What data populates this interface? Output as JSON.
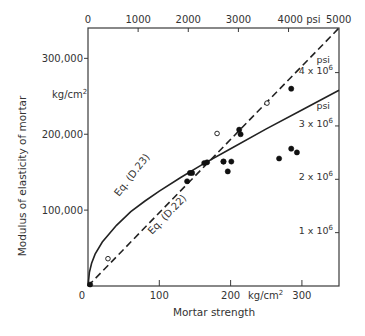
{
  "chart_data": {
    "type": "scatter",
    "title": "",
    "xlabel": "Mortar strength",
    "ylabel": "Modulus of elasticity of mortar",
    "x_unit": "kg/cm2",
    "y_unit": "kg/cm2",
    "xlim": [
      0,
      352
    ],
    "ylim": [
      0,
      340000
    ],
    "x_ticks": [
      0,
      100,
      200,
      300
    ],
    "x_tick_labels": [
      "0",
      "100",
      "200",
      "300"
    ],
    "y_ticks": [
      100000,
      200000,
      300000
    ],
    "y_tick_labels": [
      "100,000",
      "200,000",
      "300,000"
    ],
    "top_axis": {
      "unit": "psi",
      "ticks_psi": [
        0,
        1000,
        2000,
        3000,
        4000,
        5000
      ],
      "tick_labels": [
        "0",
        "1000",
        "2000",
        "3000",
        "4000 psi",
        "5000"
      ]
    },
    "right_axis": {
      "unit": "psi",
      "ticks_psi": [
        1000000,
        2000000,
        3000000,
        4000000
      ],
      "tick_labels": [
        "1 x 10^6",
        "2 x 10^6",
        "3 x 10^6",
        "4 x 10^6"
      ]
    },
    "grid": false,
    "series": [
      {
        "name": "Eq. (D.22)",
        "style": "dashed-line",
        "x": [
          0,
          352
        ],
        "y": [
          0,
          340000
        ]
      },
      {
        "name": "Eq. (D.23)",
        "style": "solid-curve",
        "x": [
          0,
          2,
          5,
          10,
          20,
          40,
          60,
          80,
          100,
          130,
          160,
          200,
          250,
          300,
          352
        ],
        "y": [
          0,
          18000,
          30000,
          42000,
          58000,
          80000,
          98000,
          112000,
          125000,
          143000,
          160000,
          181000,
          207000,
          232000,
          258000
        ]
      },
      {
        "name": "Filled points",
        "marker": "filled-circle",
        "x": [
          3,
          143,
          146,
          139,
          163,
          167,
          190,
          190,
          201,
          212,
          196,
          214,
          285,
          293,
          268,
          285
        ],
        "y": [
          2000,
          149000,
          149000,
          138000,
          162000,
          163000,
          164000,
          164000,
          164000,
          206000,
          151000,
          200000,
          181000,
          176000,
          168000,
          260000
        ]
      },
      {
        "name": "Open points",
        "marker": "open-circle",
        "x": [
          28,
          181,
          251
        ],
        "y": [
          36000,
          201000,
          241000
        ]
      }
    ],
    "annotations": [
      {
        "text": "Eq. (D.23)",
        "x": 36,
        "y": 140000,
        "rotation": -50
      },
      {
        "text": "Eq. (D.22)",
        "x": 150,
        "y": 110000,
        "rotation": -44
      },
      {
        "text": "kg/cm²",
        "position": "left-axis-unit"
      },
      {
        "text": "kg/cm²",
        "position": "bottom-axis-unit"
      },
      {
        "text": "psi",
        "position": "right-axis-unit-upper"
      },
      {
        "text": "psi",
        "position": "right-axis-unit-lower"
      }
    ]
  },
  "labels": {
    "xlabel": "Mortar strength",
    "ylabel": "Modulus of elasticity of mortar",
    "kg_unit": "kg/cm",
    "sup2": "2",
    "psi": "psi",
    "eq_d23": "Eq. (D.23)",
    "eq_d22": "Eq. (D.22)"
  }
}
